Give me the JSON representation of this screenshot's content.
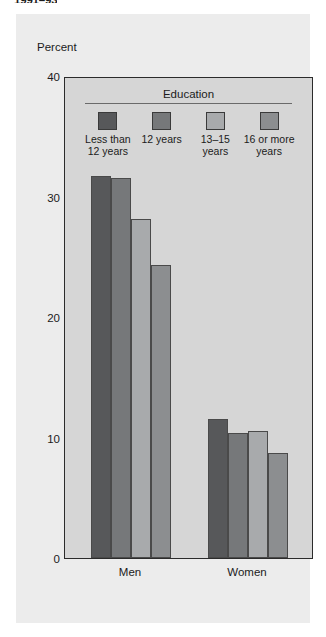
{
  "top_cut_title": "1991–93",
  "figure": {
    "y_axis_caption": "Percent",
    "legend_title": "Education",
    "x_labels": [
      "Men",
      "Women"
    ]
  },
  "chart_data": {
    "type": "bar",
    "title": "",
    "subtitle": "",
    "xlabel": "",
    "ylabel": "Percent",
    "ylim": [
      0,
      40
    ],
    "yticks": [
      0,
      10,
      20,
      30,
      40
    ],
    "ytick_labels": [
      "0",
      "10",
      "20",
      "30",
      "40"
    ],
    "grid": false,
    "legend_position": "inside-top",
    "legend_title": "Education",
    "categories": [
      "Men",
      "Women"
    ],
    "series": [
      {
        "name": "Less than 12 years",
        "values": [
          31.7,
          11.5
        ],
        "color": "#57585a"
      },
      {
        "name": "12 years",
        "values": [
          31.5,
          10.4
        ],
        "color": "#76787a"
      },
      {
        "name": "13–15 years",
        "values": [
          28.1,
          10.5
        ],
        "color": "#a8aaac"
      },
      {
        "name": "16 or more years",
        "values": [
          24.3,
          8.7
        ],
        "color": "#8c8e90"
      }
    ]
  },
  "colors": {
    "plot_background": "#d6d6d6",
    "card_background": "#ececec",
    "axis": "#2b2b2b",
    "text": "#1b1b1b"
  }
}
